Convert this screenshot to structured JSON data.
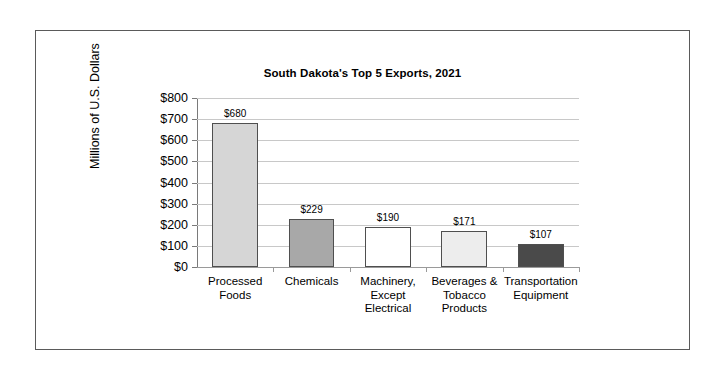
{
  "chart_data": {
    "type": "bar",
    "title": "South Dakota's Top 5 Exports, 2021",
    "xlabel": "",
    "ylabel": "Millions of U.S. Dollars",
    "categories": [
      "Processed Foods",
      "Chemicals",
      "Machinery, Except Electrical",
      "Beverages & Tobacco Products",
      "Transportation Equipment"
    ],
    "category_lines": [
      [
        "Processed",
        "Foods"
      ],
      [
        "Chemicals"
      ],
      [
        "Machinery,",
        "Except",
        "Electrical"
      ],
      [
        "Beverages &",
        "Tobacco",
        "Products"
      ],
      [
        "Transportation",
        "Equipment"
      ]
    ],
    "values": [
      680,
      229,
      190,
      171,
      107
    ],
    "value_labels": [
      "$680",
      "$229",
      "$190",
      "$171",
      "$107"
    ],
    "bar_colors": [
      "#d6d6d6",
      "#a8a8a8",
      "#ffffff",
      "#ededed",
      "#4a4a4a"
    ],
    "bar_border_color": "#4f4f4f",
    "ylim": [
      0,
      800
    ],
    "ytick_values": [
      0,
      100,
      200,
      300,
      400,
      500,
      600,
      700,
      800
    ],
    "ytick_labels": [
      "$0",
      "$100",
      "$200",
      "$300",
      "$400",
      "$500",
      "$600",
      "$700",
      "$800"
    ],
    "grid": true,
    "legend": null,
    "gridline_color": "#c8c8c8",
    "axis_color": "#7a7a7a",
    "frame_color": "#5a5a5a"
  }
}
